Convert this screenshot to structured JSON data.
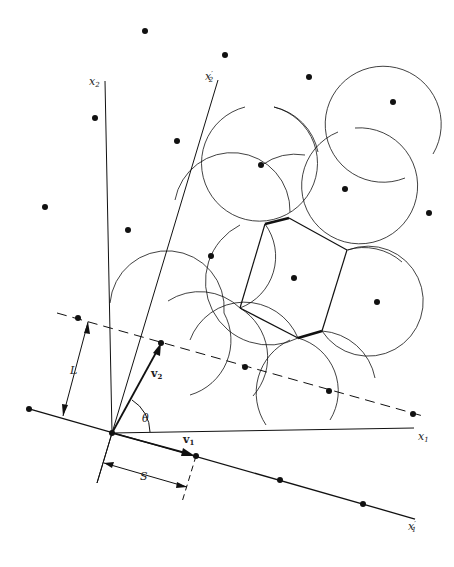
{
  "figure": {
    "colors": {
      "ink": "#111111",
      "background": "#ffffff"
    }
  },
  "labels": {
    "x1": "x",
    "x1_sub": "1",
    "x2": "x",
    "x2_sub": "2",
    "x1_prime": "x",
    "x1_prime_sub": "1",
    "x2_prime": "x",
    "x2_prime_sub": "2",
    "prime": "′",
    "v1": "v",
    "v1_sub": "1",
    "v2": "v",
    "v2_sub": "2",
    "theta": "θ",
    "L": "L",
    "S": "S"
  },
  "lattice_points": [
    [
      145,
      31
    ],
    [
      225,
      55
    ],
    [
      309,
      77
    ],
    [
      393,
      102
    ],
    [
      95,
      118
    ],
    [
      177,
      141
    ],
    [
      261,
      165
    ],
    [
      345,
      189
    ],
    [
      429,
      213
    ],
    [
      45,
      207
    ],
    [
      128,
      230
    ],
    [
      211,
      256
    ],
    [
      294,
      278
    ],
    [
      377,
      302
    ],
    [
      78,
      318
    ],
    [
      161,
      343
    ],
    [
      245,
      367
    ],
    [
      329,
      391
    ],
    [
      413,
      414
    ],
    [
      29,
      409
    ],
    [
      112,
      433
    ],
    [
      196,
      456
    ],
    [
      280,
      480
    ],
    [
      363,
      504
    ]
  ]
}
